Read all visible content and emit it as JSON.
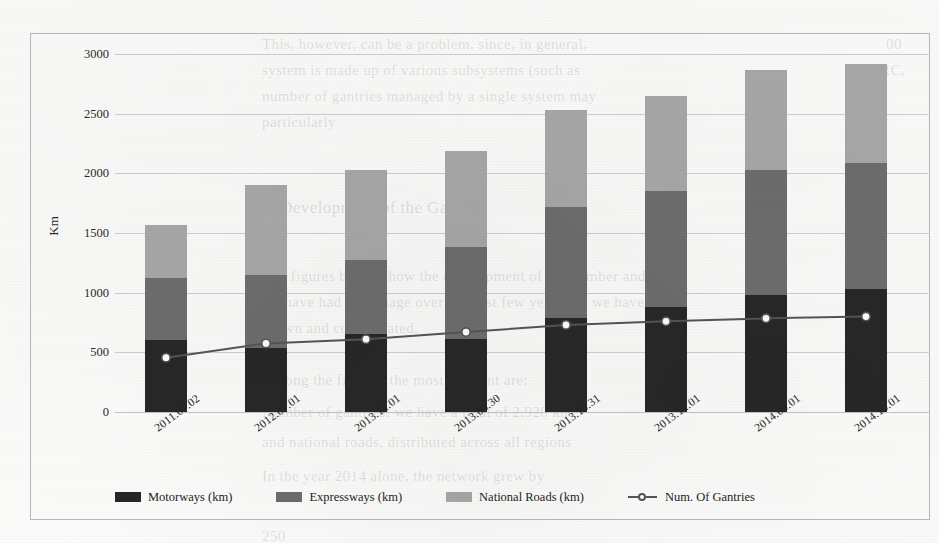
{
  "chart_data": {
    "type": "bar",
    "subtype": "stacked-bar-with-line",
    "title": "",
    "xlabel": "",
    "ylabel": "Km",
    "ylim": [
      0,
      3000
    ],
    "ytick_step": 500,
    "yticks": [
      "3000",
      "2500",
      "2000",
      "1500",
      "1000",
      "500",
      "0"
    ],
    "grid": true,
    "legend_position": "bottom",
    "categories": [
      "2011.07.02",
      "2012.07.01",
      "2013.12.01",
      "2013.03.30",
      "2013.10.31",
      "2013.12.01",
      "2014.09.01",
      "2014.10.01"
    ],
    "series": [
      {
        "name": "Motorways (km)",
        "type": "bar",
        "color": "#272727",
        "values": [
          600,
          540,
          650,
          610,
          790,
          880,
          980,
          1030
        ]
      },
      {
        "name": "Expressways (km)",
        "type": "bar",
        "color": "#6d6d6d",
        "values": [
          520,
          610,
          620,
          770,
          930,
          970,
          1050,
          1055
        ]
      },
      {
        "name": "National Roads (km)",
        "type": "bar",
        "color": "#a8a8a8",
        "values": [
          450,
          750,
          760,
          810,
          810,
          800,
          840,
          835
        ]
      },
      {
        "name": "Num. Of Gantries",
        "type": "line",
        "color": "#555555",
        "marker": "circle-open",
        "values": [
          455,
          575,
          610,
          670,
          730,
          760,
          785,
          800
        ]
      }
    ],
    "totals": [
      1570,
      1900,
      2030,
      2190,
      2530,
      2650,
      2870,
      2920
    ]
  },
  "legend": {
    "items": [
      {
        "label": "Motorways (km)",
        "swatch": "#272727",
        "kind": "swatch"
      },
      {
        "label": "Expressways (km)",
        "swatch": "#6d6d6d",
        "kind": "swatch"
      },
      {
        "label": "National Roads (km)",
        "swatch": "#a8a8a8",
        "kind": "swatch"
      },
      {
        "label": "Num. Of Gantries",
        "swatch": "#555555",
        "kind": "line-marker"
      }
    ]
  },
  "background_text": [
    {
      "text": "This, however, can be a problem, since, in general,",
      "x": 262,
      "y": 36,
      "size": 15
    },
    {
      "text": "00",
      "x": 886,
      "y": 36,
      "size": 15
    },
    {
      "text": "system is made up of various subsystems (such as",
      "x": 262,
      "y": 62,
      "size": 15
    },
    {
      "text": "DSRC,",
      "x": 860,
      "y": 62,
      "size": 15
    },
    {
      "text": "number of gantries managed by a single system may",
      "x": 262,
      "y": 88,
      "size": 15
    },
    {
      "text": "particularly",
      "x": 262,
      "y": 114,
      "size": 15
    },
    {
      "text": "6.  Development of the Gantries",
      "x": 262,
      "y": 198,
      "size": 17
    },
    {
      "text": "The figures below show the development of the number and",
      "x": 262,
      "y": 268,
      "size": 15
    },
    {
      "text": "we have had to manage over the past few years. As we have",
      "x": 262,
      "y": 294,
      "size": 15
    },
    {
      "text": "grown and consolidated.",
      "x": 262,
      "y": 320,
      "size": 15
    },
    {
      "text": "Among the figures, the most relevant are:",
      "x": 262,
      "y": 372,
      "size": 15
    },
    {
      "text": "Number of gantries: we have a total of 2,920 km",
      "x": 262,
      "y": 404,
      "size": 15
    },
    {
      "text": "and national roads, distributed across all regions",
      "x": 262,
      "y": 434,
      "size": 15
    },
    {
      "text": "In the year 2014 alone, the network grew by",
      "x": 262,
      "y": 468,
      "size": 15
    },
    {
      "text": "250",
      "x": 262,
      "y": 528,
      "size": 15
    }
  ],
  "colors": {
    "motorways": "#272727",
    "expressways": "#6d6d6d",
    "national_roads": "#a8a8a8",
    "gantries_line": "#555555",
    "gridline": "#cfcfcf",
    "frame": "#b9b9b9",
    "background": "#fbfbfa"
  }
}
